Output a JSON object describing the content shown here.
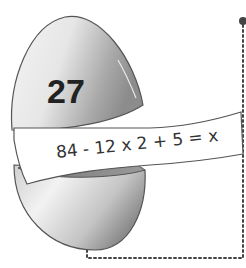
{
  "egg": {
    "number": "27",
    "equation": "84 - 12 x 2 + 5 = x"
  },
  "colors": {
    "egg_light": "#f2f2f2",
    "egg_dark": "#9a9a9a",
    "outline": "#555555",
    "dots": "#444444"
  }
}
